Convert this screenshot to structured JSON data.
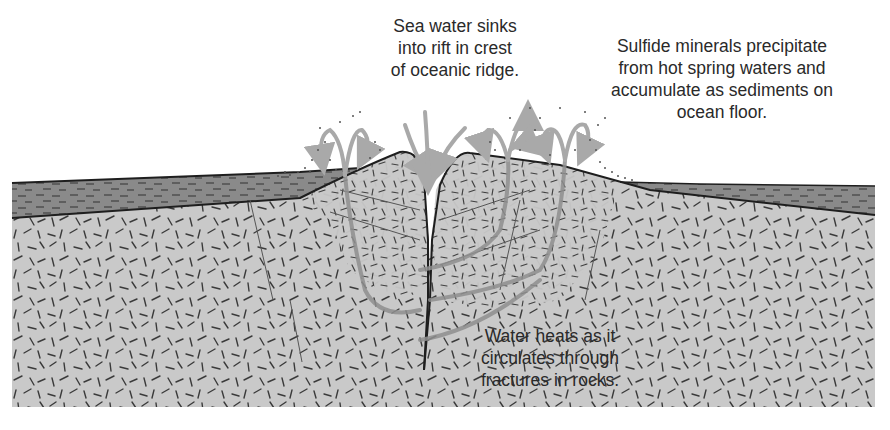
{
  "diagram": {
    "labels": {
      "sinks": {
        "lines": [
          "Sea water sinks",
          "into rift in crest",
          "of oceanic ridge."
        ]
      },
      "sulfide": {
        "lines": [
          "Sulfide minerals precipitate",
          "from hot spring waters and",
          "accumulate as sediments on",
          "ocean floor."
        ]
      },
      "heats": {
        "lines": [
          "Water heats as it",
          "circulates through",
          "fractures in rocks."
        ]
      }
    },
    "colors": {
      "background": "#ffffff",
      "rock": "#c9c9c9",
      "sediment": "#8a8a8a",
      "outline": "#1e1e1e",
      "fracture_dash": "#3a3a3a",
      "flow_arrow": "#a9a9a9",
      "text": "#2a2a2a"
    },
    "components": [
      "left-sediment-layer",
      "right-sediment-layer",
      "left-ridge-block",
      "right-ridge-block",
      "central-rift",
      "descending-water-arrows",
      "rising-hot-spring-arrows",
      "circulation-paths",
      "precipitate-particles"
    ]
  }
}
